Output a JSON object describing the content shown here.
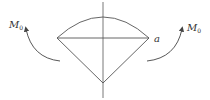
{
  "diagram": {
    "colors": {
      "stroke": "#555555",
      "text": "#333333",
      "background": "#ffffff"
    },
    "labels": {
      "moment_left": {
        "main": "M",
        "sub": "0"
      },
      "moment_right": {
        "main": "M",
        "sub": "0"
      },
      "point_a": "a"
    },
    "shape": {
      "left_vertex": [
        57,
        38
      ],
      "right_vertex": [
        149,
        38
      ],
      "bottom_vertex": [
        103,
        83
      ],
      "arc_top": [
        103,
        17
      ],
      "axis_x": 103,
      "axis_y_range": [
        2,
        98
      ]
    },
    "arrows": [
      {
        "name": "left-moment",
        "from": [
          60,
          62
        ],
        "to": [
          25,
          27
        ],
        "direction": "counterclockwise"
      },
      {
        "name": "right-moment",
        "from": [
          147,
          62
        ],
        "to": [
          183,
          27
        ],
        "direction": "clockwise"
      }
    ]
  }
}
